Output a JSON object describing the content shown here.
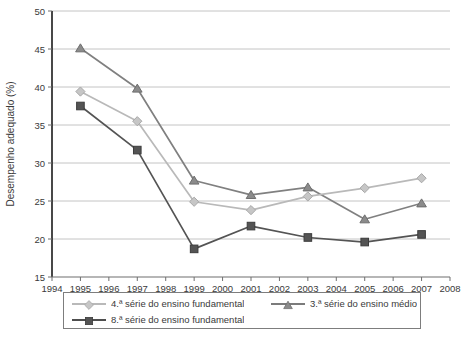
{
  "chart_data": {
    "type": "line",
    "title": "",
    "xlabel": "",
    "ylabel": "Desempenho adequado (%)",
    "xlim": [
      1994,
      2008
    ],
    "ylim": [
      15,
      50
    ],
    "xticks": [
      1994,
      1995,
      1996,
      1997,
      1998,
      1999,
      2000,
      2001,
      2002,
      2003,
      2004,
      2005,
      2006,
      2007,
      2008
    ],
    "yticks": [
      15,
      20,
      25,
      30,
      35,
      40,
      45,
      50
    ],
    "grid": "horizontal",
    "legend_position": "bottom",
    "x": [
      1995,
      1997,
      1999,
      2001,
      2003,
      2005,
      2007
    ],
    "series": [
      {
        "name": "4.ª série do ensino fundamental",
        "marker": "diamond",
        "color": "#b9b9b9",
        "values": [
          39.4,
          35.5,
          24.9,
          23.8,
          25.6,
          26.7,
          28.0
        ]
      },
      {
        "name": "3.ª série do ensino médio",
        "marker": "triangle",
        "color": "#808080",
        "values": [
          45.1,
          39.8,
          27.7,
          25.8,
          26.8,
          22.6,
          24.7
        ]
      },
      {
        "name": "8.ª série do ensino fundamental",
        "marker": "square",
        "color": "#545454",
        "values": [
          37.5,
          31.7,
          18.7,
          21.7,
          20.2,
          19.6,
          20.6
        ]
      }
    ]
  },
  "axes": {
    "ylabel": "Desempenho adequado (%)",
    "ytick_labels": [
      "50",
      "45",
      "40",
      "35",
      "30",
      "25",
      "20",
      "15"
    ],
    "xtick_labels": [
      "1994",
      "1995",
      "1996",
      "1997",
      "1998",
      "1999",
      "2000",
      "2001",
      "2002",
      "2003",
      "2004",
      "2005",
      "2006",
      "2007",
      "2008"
    ]
  },
  "legend": {
    "entries": [
      {
        "label": "4.ª série do ensino fundamental",
        "marker": "diamond",
        "color": "#b9b9b9"
      },
      {
        "label": "8.ª série do ensino fundamental",
        "marker": "square",
        "color": "#545454"
      },
      {
        "label": "3.ª série do ensino médio",
        "marker": "triangle",
        "color": "#808080"
      }
    ]
  },
  "source": {
    "text": ""
  }
}
